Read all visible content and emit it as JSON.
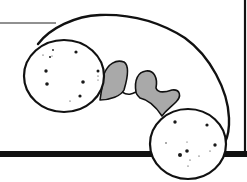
{
  "illustration": {
    "subject": "dumbbell-shaped cell with two spherical ends and gray connecting lobes",
    "colors": {
      "background": "#ffffff",
      "outline": "#111111",
      "lobe_fill": "#a9a9a9",
      "dots": "#1a1a1a"
    }
  },
  "frame": {
    "top_line": {
      "x1": 0,
      "x2": 56,
      "y": 23
    },
    "right_line": {
      "x": 245,
      "y1": 0,
      "y2": 154
    },
    "bottom_bar": {
      "y": 154,
      "thickness": 6
    }
  }
}
